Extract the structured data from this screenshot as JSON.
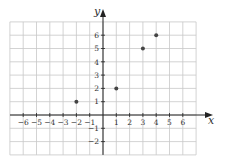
{
  "chart_data": {
    "type": "scatter",
    "title": "",
    "xlabel": "x",
    "ylabel": "y",
    "xlim": [
      -7,
      7
    ],
    "ylim": [
      -3,
      7
    ],
    "grid": true,
    "x_ticks": [
      -6,
      -5,
      -4,
      -3,
      -2,
      -1,
      1,
      2,
      3,
      4,
      5,
      6
    ],
    "y_ticks": [
      -2,
      -1,
      1,
      2,
      3,
      4,
      5,
      6
    ],
    "x_tick_labels": [
      "−6",
      "−5",
      "−4",
      "−3",
      "−2",
      "−1",
      "1",
      "2",
      "3",
      "4",
      "5",
      "6"
    ],
    "y_tick_labels": [
      "−2",
      "−1",
      "1",
      "2",
      "3",
      "4",
      "5",
      "6"
    ],
    "points": [
      {
        "x": -2,
        "y": 1
      },
      {
        "x": 1,
        "y": 2
      },
      {
        "x": 3,
        "y": 5
      },
      {
        "x": 4,
        "y": 6
      }
    ]
  },
  "colors": {
    "grid": "#c8c8c8",
    "axis": "#222222",
    "point": "#444444"
  }
}
